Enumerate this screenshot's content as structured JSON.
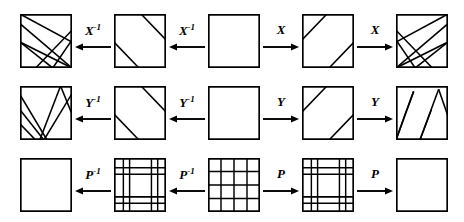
{
  "figure": {
    "stroke_color": "#000000",
    "background_color": "#ffffff",
    "rows": [
      {
        "id": "row-x",
        "operator": "X",
        "squares": [
          {
            "name": "square-x-1",
            "pattern": "fan-converging-right",
            "lines": [
              {
                "x1": 0,
                "y1": 18,
                "x2": 100,
                "y2": 100
              },
              {
                "x1": 0,
                "y1": 52,
                "x2": 100,
                "y2": 100
              },
              {
                "x1": 0,
                "y1": 0,
                "x2": 100,
                "y2": 52
              },
              {
                "x1": 30,
                "y1": 100,
                "x2": 100,
                "y2": 30
              },
              {
                "x1": 63,
                "y1": 100,
                "x2": 100,
                "y2": 48
              },
              {
                "x1": 0,
                "y1": 52,
                "x2": 63,
                "y2": 100
              }
            ]
          },
          {
            "name": "square-x-2",
            "pattern": "two-parallel-diagonals",
            "lines": [
              {
                "x1": 0,
                "y1": 52,
                "x2": 48,
                "y2": 100
              },
              {
                "x1": 52,
                "y1": 0,
                "x2": 100,
                "y2": 48
              }
            ]
          },
          {
            "name": "square-x-3",
            "pattern": "empty",
            "lines": []
          },
          {
            "name": "square-x-4",
            "pattern": "two-parallel-diagonals-mirrored",
            "lines": [
              {
                "x1": 0,
                "y1": 48,
                "x2": 48,
                "y2": 0
              },
              {
                "x1": 52,
                "y1": 100,
                "x2": 100,
                "y2": 52
              }
            ]
          },
          {
            "name": "square-x-5",
            "pattern": "fan-converging-left",
            "lines": [
              {
                "x1": 100,
                "y1": 18,
                "x2": 0,
                "y2": 100
              },
              {
                "x1": 100,
                "y1": 52,
                "x2": 0,
                "y2": 100
              },
              {
                "x1": 100,
                "y1": 0,
                "x2": 0,
                "y2": 52
              },
              {
                "x1": 70,
                "y1": 100,
                "x2": 0,
                "y2": 30
              },
              {
                "x1": 37,
                "y1": 100,
                "x2": 0,
                "y2": 48
              },
              {
                "x1": 100,
                "y1": 52,
                "x2": 37,
                "y2": 100
              }
            ]
          }
        ],
        "arrows": [
          {
            "name": "arrow-x-inv-1",
            "label": "X",
            "superscript": "-1",
            "direction": "left"
          },
          {
            "name": "arrow-x-inv-2",
            "label": "X",
            "superscript": "-1",
            "direction": "left"
          },
          {
            "name": "arrow-x-fwd-1",
            "label": "X",
            "superscript": "",
            "direction": "right"
          },
          {
            "name": "arrow-x-fwd-2",
            "label": "X",
            "superscript": "",
            "direction": "right"
          }
        ]
      },
      {
        "id": "row-y",
        "operator": "Y",
        "squares": [
          {
            "name": "square-y-1",
            "pattern": "steep-fan-right",
            "lines": [
              {
                "x1": 0,
                "y1": 44,
                "x2": 46,
                "y2": 100
              },
              {
                "x1": 0,
                "y1": 70,
                "x2": 30,
                "y2": 100
              },
              {
                "x1": 0,
                "y1": 16,
                "x2": 52,
                "y2": 100
              },
              {
                "x1": 38,
                "y1": 100,
                "x2": 78,
                "y2": 0
              },
              {
                "x1": 46,
                "y1": 100,
                "x2": 100,
                "y2": 14
              },
              {
                "x1": 78,
                "y1": 0,
                "x2": 100,
                "y2": 52
              }
            ]
          },
          {
            "name": "square-y-2",
            "pattern": "two-steep-diagonals",
            "lines": [
              {
                "x1": 0,
                "y1": 52,
                "x2": 48,
                "y2": 100
              },
              {
                "x1": 52,
                "y1": 0,
                "x2": 100,
                "y2": 48
              }
            ]
          },
          {
            "name": "square-y-3",
            "pattern": "empty",
            "lines": []
          },
          {
            "name": "square-y-4",
            "pattern": "two-steep-diagonals-mirrored",
            "lines": [
              {
                "x1": 0,
                "y1": 48,
                "x2": 48,
                "y2": 0
              },
              {
                "x1": 52,
                "y1": 100,
                "x2": 100,
                "y2": 52
              }
            ]
          },
          {
            "name": "square-y-5",
            "pattern": "steep-fan-left",
            "lines": [
              {
                "x1": 0,
                "y1": 100,
                "x2": 34,
                "y2": 10
              },
              {
                "x1": 0,
                "y1": 100,
                "x2": 20,
                "y2": 46
              },
              {
                "x1": 20,
                "y1": 46,
                "x2": 34,
                "y2": 10
              },
              {
                "x1": 46,
                "y1": 100,
                "x2": 82,
                "y2": 6
              },
              {
                "x1": 46,
                "y1": 100,
                "x2": 68,
                "y2": 44
              },
              {
                "x1": 82,
                "y1": 6,
                "x2": 100,
                "y2": 56
              }
            ]
          }
        ],
        "arrows": [
          {
            "name": "arrow-y-inv-1",
            "label": "Y",
            "superscript": "-1",
            "direction": "left"
          },
          {
            "name": "arrow-y-inv-2",
            "label": "Y",
            "superscript": "-1",
            "direction": "left"
          },
          {
            "name": "arrow-y-fwd-1",
            "label": "Y",
            "superscript": "",
            "direction": "right"
          },
          {
            "name": "arrow-y-fwd-2",
            "label": "Y",
            "superscript": "",
            "direction": "right"
          }
        ]
      },
      {
        "id": "row-p",
        "operator": "P",
        "squares": [
          {
            "name": "square-p-1",
            "pattern": "empty",
            "grid_v": [],
            "grid_h": []
          },
          {
            "name": "square-p-2",
            "pattern": "sparse-grid",
            "grid_v": [
              18,
              30,
              72,
              84
            ],
            "grid_h": [
              18,
              30,
              72,
              84
            ]
          },
          {
            "name": "square-p-3",
            "pattern": "dense-grid-4x4",
            "grid_v": [
              25,
              50,
              75
            ],
            "grid_h": [
              25,
              50,
              75
            ]
          },
          {
            "name": "square-p-4",
            "pattern": "sparse-grid",
            "grid_v": [
              18,
              30,
              72,
              84
            ],
            "grid_h": [
              18,
              30,
              72,
              84
            ]
          },
          {
            "name": "square-p-5",
            "pattern": "empty",
            "grid_v": [],
            "grid_h": []
          }
        ],
        "arrows": [
          {
            "name": "arrow-p-inv-1",
            "label": "P",
            "superscript": "-1",
            "direction": "left"
          },
          {
            "name": "arrow-p-inv-2",
            "label": "P",
            "superscript": "-1",
            "direction": "left"
          },
          {
            "name": "arrow-p-fwd-1",
            "label": "P",
            "superscript": "",
            "direction": "right"
          },
          {
            "name": "arrow-p-fwd-2",
            "label": "P",
            "superscript": "",
            "direction": "right"
          }
        ]
      }
    ]
  }
}
